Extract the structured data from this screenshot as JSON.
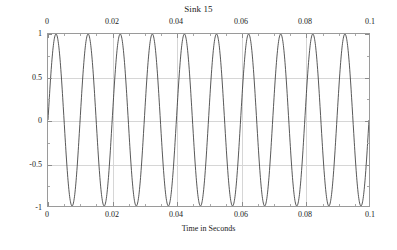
{
  "chart_data": {
    "type": "line",
    "title": "Sink 15",
    "xlabel": "Time in Seconds",
    "ylabel": "Amplitude",
    "xlim": [
      0,
      0.1
    ],
    "ylim": [
      -1,
      1
    ],
    "grid": true,
    "legend": null,
    "line_color": "#3a3a3a",
    "grid_color": "#d6d6d6",
    "frame_color": "#9a9a9a",
    "x_ticks": [
      0,
      0.02,
      0.04,
      0.06,
      0.08,
      0.1
    ],
    "x_tick_labels": [
      "0",
      "0.02",
      "0.04",
      "0.06",
      "0.08",
      "0.1"
    ],
    "x_minor_per_major": 4,
    "y_ticks": [
      1,
      0.5,
      0,
      -0.5,
      -1
    ],
    "y_tick_labels": [
      "1",
      "0.5",
      "0",
      "-0.5",
      "-1"
    ],
    "y_minor_per_major": 2,
    "x_axis_top": true,
    "x_axis_bottom": true,
    "series": [
      {
        "name": "sine",
        "waveform": "sine",
        "frequency_hz": 100,
        "amplitude": 1,
        "phase_rad": 0,
        "offset": 0,
        "cycles_shown": 10,
        "samples": 1200
      }
    ]
  },
  "plot": {
    "title": "Sink 15",
    "x_axis_title": "Time in Seconds",
    "y_axis_title": "Amplitude"
  }
}
